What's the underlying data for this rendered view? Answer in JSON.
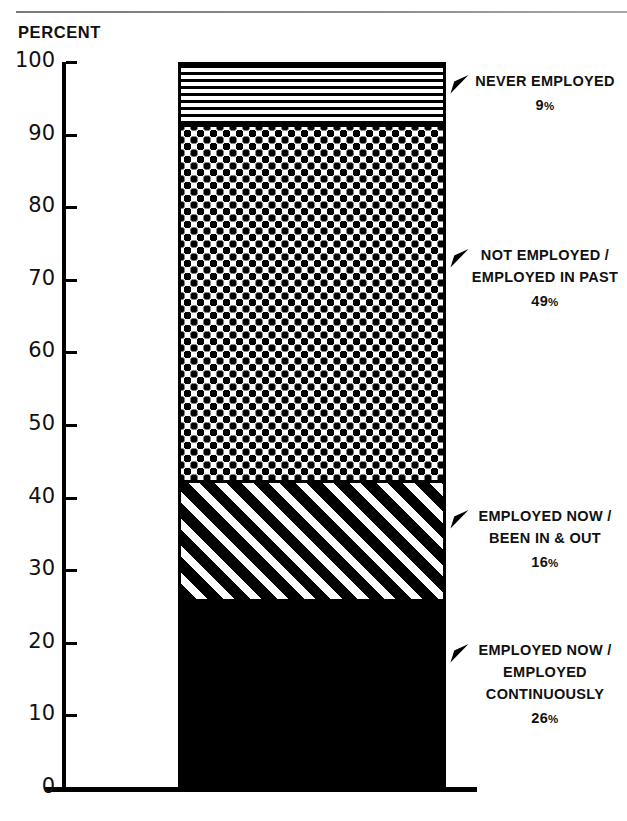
{
  "chart_data": {
    "type": "bar",
    "subtype": "stacked-single-bar",
    "title": "",
    "ylabel": "PERCENT",
    "xlabel": "",
    "ylim": [
      0,
      100
    ],
    "yticks": [
      0,
      10,
      20,
      30,
      40,
      50,
      60,
      70,
      80,
      90,
      100
    ],
    "ytick_labels": [
      "0",
      "10",
      "20",
      "30",
      "40",
      "50",
      "60",
      "70",
      "80",
      "90",
      "100"
    ],
    "grid": false,
    "legend": "callout-labels-right",
    "categories": [
      "All"
    ],
    "series": [
      {
        "name": "EMPLOYED NOW / EMPLOYED CONTINUOUSLY",
        "value": 26,
        "pattern": "solid-black",
        "cumulative_bottom": 0,
        "cumulative_top": 26
      },
      {
        "name": "EMPLOYED NOW / BEEN IN & OUT",
        "value": 16,
        "pattern": "diagonal-stripes",
        "cumulative_bottom": 26,
        "cumulative_top": 42
      },
      {
        "name": "NOT EMPLOYED / EMPLOYED IN PAST",
        "value": 49,
        "pattern": "dots",
        "cumulative_bottom": 42,
        "cumulative_top": 91
      },
      {
        "name": "NEVER EMPLOYED",
        "value": 9,
        "pattern": "horizontal-lines",
        "cumulative_bottom": 91,
        "cumulative_top": 100
      }
    ]
  },
  "axis": {
    "title": "PERCENT",
    "ticks": [
      {
        "value": 100,
        "label": "100"
      },
      {
        "value": 90,
        "label": "90"
      },
      {
        "value": 80,
        "label": "80"
      },
      {
        "value": 70,
        "label": "70"
      },
      {
        "value": 60,
        "label": "60"
      },
      {
        "value": 50,
        "label": "50"
      },
      {
        "value": 40,
        "label": "40"
      },
      {
        "value": 30,
        "label": "30"
      },
      {
        "value": 20,
        "label": "20"
      },
      {
        "value": 10,
        "label": "10"
      },
      {
        "value": 0,
        "label": "0"
      }
    ]
  },
  "callouts": [
    {
      "id": "never-employed",
      "lines": [
        "NEVER EMPLOYED"
      ],
      "percent": "9",
      "percent_symbol": "%",
      "at_value": 95.5
    },
    {
      "id": "not-employed-employed-in-past",
      "lines": [
        "NOT EMPLOYED /",
        "EMPLOYED IN PAST"
      ],
      "percent": "49",
      "percent_symbol": "%",
      "at_value": 70
    },
    {
      "id": "employed-now-been-in-and-out",
      "lines": [
        "EMPLOYED NOW /",
        "BEEN IN & OUT"
      ],
      "percent": "16",
      "percent_symbol": "%",
      "at_value": 34
    },
    {
      "id": "employed-now-employed-continuously",
      "lines": [
        "EMPLOYED NOW /",
        "EMPLOYED",
        "CONTINUOUSLY"
      ],
      "percent": "26",
      "percent_symbol": "%",
      "at_value": 14
    }
  ],
  "colors": {
    "ink": "#000000",
    "paper": "#ffffff",
    "rule": "#8d8d8d"
  }
}
